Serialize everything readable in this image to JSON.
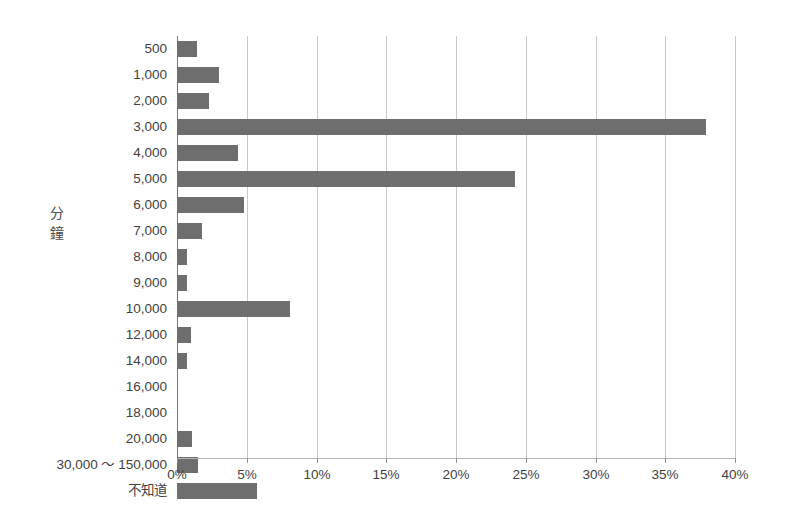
{
  "chart_data": {
    "type": "bar",
    "orientation": "horizontal",
    "title": "",
    "xlabel": "",
    "ylabel": "分鐘",
    "xlim": [
      0,
      40
    ],
    "xtick_labels": [
      "0%",
      "5%",
      "10%",
      "15%",
      "20%",
      "25%",
      "30%",
      "35%",
      "40%"
    ],
    "xticks": [
      0,
      5,
      10,
      15,
      20,
      25,
      30,
      35,
      40
    ],
    "grid": "vertical",
    "legend": "none",
    "unit": "%",
    "bar_color": "#6e6e6e",
    "gridline_color": "#c8c8c8",
    "background_color": "#ffffff",
    "categories": [
      "500",
      "1,000",
      "2,000",
      "3,000",
      "4,000",
      "5,000",
      "6,000",
      "7,000",
      "8,000",
      "9,000",
      "10,000",
      "12,000",
      "14,000",
      "16,000",
      "18,000",
      "20,000",
      "30,000 ～ 150,000",
      "不知道"
    ],
    "values": [
      1.4,
      3.0,
      2.3,
      37.9,
      4.4,
      24.2,
      4.8,
      1.8,
      0.7,
      0.7,
      8.1,
      1.0,
      0.7,
      0.0,
      0.0,
      1.1,
      1.5,
      5.7
    ]
  },
  "axis_title_chars": [
    "分",
    "鐘"
  ]
}
